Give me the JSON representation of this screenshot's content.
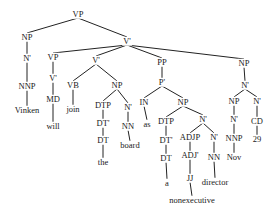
{
  "diagram": {
    "type": "syntax-tree",
    "sentence": "Vinken will join the board as a nonexecutive director Nov 29",
    "line_color": "#222222",
    "nodes": [
      {
        "id": "n0",
        "label": "VP",
        "x": 78,
        "y": 14
      },
      {
        "id": "n1",
        "label": "NP",
        "x": 27,
        "y": 37
      },
      {
        "id": "n2",
        "label": "N'",
        "x": 27,
        "y": 58
      },
      {
        "id": "n3",
        "label": "NNP",
        "x": 27,
        "y": 86
      },
      {
        "id": "n4",
        "label": "Vinken",
        "x": 27,
        "y": 110,
        "word": true
      },
      {
        "id": "n5",
        "label": "V'",
        "x": 127,
        "y": 41
      },
      {
        "id": "n6",
        "label": "VP",
        "x": 53,
        "y": 57
      },
      {
        "id": "n7",
        "label": "V'",
        "x": 53,
        "y": 78
      },
      {
        "id": "n8",
        "label": "MD",
        "x": 53,
        "y": 99
      },
      {
        "id": "n9",
        "label": "will",
        "x": 53,
        "y": 126,
        "word": true
      },
      {
        "id": "n10",
        "label": "V'",
        "x": 96,
        "y": 60
      },
      {
        "id": "n11",
        "label": "VB",
        "x": 73,
        "y": 85
      },
      {
        "id": "n12",
        "label": "join",
        "x": 73,
        "y": 109,
        "word": true
      },
      {
        "id": "n13",
        "label": "NP",
        "x": 117,
        "y": 85
      },
      {
        "id": "n14",
        "label": "DTP",
        "x": 103,
        "y": 105
      },
      {
        "id": "n15",
        "label": "DT'",
        "x": 103,
        "y": 123
      },
      {
        "id": "n16",
        "label": "DT",
        "x": 103,
        "y": 140
      },
      {
        "id": "n17",
        "label": "the",
        "x": 103,
        "y": 162,
        "word": true
      },
      {
        "id": "n18",
        "label": "N'",
        "x": 128,
        "y": 107
      },
      {
        "id": "n19",
        "label": "NN",
        "x": 128,
        "y": 126
      },
      {
        "id": "n20",
        "label": "board",
        "x": 130,
        "y": 145,
        "word": true
      },
      {
        "id": "n21",
        "label": "PP",
        "x": 162,
        "y": 62
      },
      {
        "id": "n22",
        "label": "P'",
        "x": 162,
        "y": 82
      },
      {
        "id": "n23",
        "label": "IN",
        "x": 144,
        "y": 102
      },
      {
        "id": "n24",
        "label": "as",
        "x": 147,
        "y": 124,
        "word": true
      },
      {
        "id": "n25",
        "label": "NP",
        "x": 183,
        "y": 102
      },
      {
        "id": "n26",
        "label": "DTP",
        "x": 166,
        "y": 121
      },
      {
        "id": "n27",
        "label": "DT'",
        "x": 166,
        "y": 140
      },
      {
        "id": "n28",
        "label": "DT",
        "x": 166,
        "y": 158
      },
      {
        "id": "n29",
        "label": "a",
        "x": 167,
        "y": 183,
        "word": true
      },
      {
        "id": "n30",
        "label": "N'",
        "x": 203,
        "y": 119
      },
      {
        "id": "n31",
        "label": "ADJP",
        "x": 190,
        "y": 137
      },
      {
        "id": "n32",
        "label": "ADJ'",
        "x": 190,
        "y": 155
      },
      {
        "id": "n33",
        "label": "JJ",
        "x": 190,
        "y": 178
      },
      {
        "id": "n34",
        "label": "nonexecutive",
        "x": 192,
        "y": 200,
        "word": true
      },
      {
        "id": "n35",
        "label": "N'",
        "x": 214,
        "y": 137
      },
      {
        "id": "n36",
        "label": "NN",
        "x": 214,
        "y": 157
      },
      {
        "id": "n37",
        "label": "director",
        "x": 215,
        "y": 182,
        "word": true
      },
      {
        "id": "n38",
        "label": "NP",
        "x": 244,
        "y": 63
      },
      {
        "id": "n39",
        "label": "N'",
        "x": 245,
        "y": 85
      },
      {
        "id": "n40",
        "label": "NP",
        "x": 234,
        "y": 101
      },
      {
        "id": "n41",
        "label": "N'",
        "x": 234,
        "y": 119
      },
      {
        "id": "n42",
        "label": "NNP",
        "x": 234,
        "y": 138
      },
      {
        "id": "n43",
        "label": "Nov",
        "x": 234,
        "y": 157,
        "word": true
      },
      {
        "id": "n44",
        "label": "N'",
        "x": 257,
        "y": 101
      },
      {
        "id": "n45",
        "label": "CD",
        "x": 257,
        "y": 121
      },
      {
        "id": "n46",
        "label": "29",
        "x": 257,
        "y": 139,
        "word": true
      }
    ],
    "edges": [
      [
        "n0",
        "n1"
      ],
      [
        "n1",
        "n2"
      ],
      [
        "n2",
        "n3"
      ],
      [
        "n3",
        "n4"
      ],
      [
        "n0",
        "n5"
      ],
      [
        "n5",
        "n6"
      ],
      [
        "n6",
        "n7"
      ],
      [
        "n7",
        "n8"
      ],
      [
        "n8",
        "n9"
      ],
      [
        "n5",
        "n10"
      ],
      [
        "n10",
        "n11"
      ],
      [
        "n11",
        "n12"
      ],
      [
        "n10",
        "n13"
      ],
      [
        "n13",
        "n14"
      ],
      [
        "n14",
        "n15"
      ],
      [
        "n15",
        "n16"
      ],
      [
        "n16",
        "n17"
      ],
      [
        "n13",
        "n18"
      ],
      [
        "n18",
        "n19"
      ],
      [
        "n19",
        "n20"
      ],
      [
        "n5",
        "n21"
      ],
      [
        "n21",
        "n22"
      ],
      [
        "n22",
        "n23"
      ],
      [
        "n23",
        "n24"
      ],
      [
        "n22",
        "n25"
      ],
      [
        "n25",
        "n26"
      ],
      [
        "n26",
        "n27"
      ],
      [
        "n27",
        "n28"
      ],
      [
        "n28",
        "n29"
      ],
      [
        "n25",
        "n30"
      ],
      [
        "n30",
        "n31"
      ],
      [
        "n31",
        "n32"
      ],
      [
        "n32",
        "n33"
      ],
      [
        "n33",
        "n34"
      ],
      [
        "n30",
        "n35"
      ],
      [
        "n35",
        "n36"
      ],
      [
        "n36",
        "n37"
      ],
      [
        "n5",
        "n38"
      ],
      [
        "n38",
        "n39"
      ],
      [
        "n39",
        "n40"
      ],
      [
        "n40",
        "n41"
      ],
      [
        "n41",
        "n42"
      ],
      [
        "n42",
        "n43"
      ],
      [
        "n39",
        "n44"
      ],
      [
        "n44",
        "n45"
      ],
      [
        "n45",
        "n46"
      ]
    ]
  }
}
